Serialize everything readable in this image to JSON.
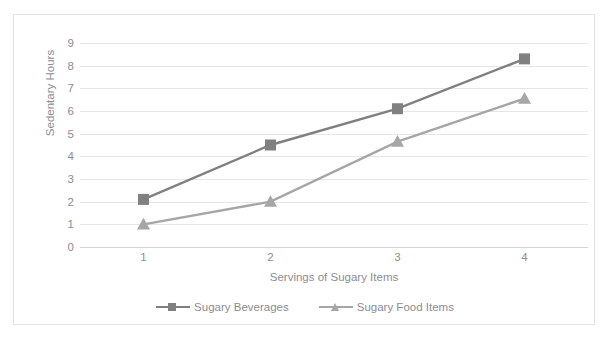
{
  "top_caption": "",
  "chart_data": {
    "type": "line",
    "title": "",
    "xlabel": "Servings of Sugary Items",
    "ylabel": "Sedentary Hours",
    "categories": [
      "1",
      "2",
      "3",
      "4"
    ],
    "yticks": [
      "0",
      "1",
      "2",
      "3",
      "4",
      "5",
      "6",
      "7",
      "8",
      "9"
    ],
    "ylim": [
      0,
      9
    ],
    "grid": true,
    "legend_position": "bottom",
    "series": [
      {
        "name": "Sugary Beverages",
        "values": [
          2.1,
          4.5,
          6.1,
          8.3
        ],
        "color": "#808080",
        "marker": "square"
      },
      {
        "name": "Sugary Food Items",
        "values": [
          1.0,
          2.0,
          4.65,
          6.55
        ],
        "color": "#a6a6a6",
        "marker": "triangle"
      }
    ]
  },
  "colors": {
    "gridline": "#e6e6e9",
    "axis": "#d5d5d9",
    "tick_text": "#8d8d92",
    "frame": "#e3e3e6",
    "background": "#ffffff"
  }
}
